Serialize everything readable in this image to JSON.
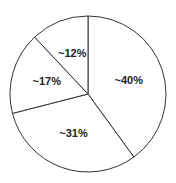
{
  "chart_data": {
    "type": "pie",
    "title": "",
    "categories": [
      "Slice A",
      "Slice B",
      "Slice C",
      "Slice D"
    ],
    "values": [
      40,
      31,
      17,
      12
    ],
    "labels": [
      "~40%",
      "~31%",
      "~17%",
      "~12%"
    ],
    "start_angle": "12 o'clock",
    "direction": "clockwise",
    "legend": "none",
    "colors": [
      "#ffffff",
      "#ffffff",
      "#ffffff",
      "#ffffff"
    ],
    "stroke_color": "#333333"
  },
  "geometry": {
    "cx": 88,
    "cy": 94,
    "r": 78
  }
}
